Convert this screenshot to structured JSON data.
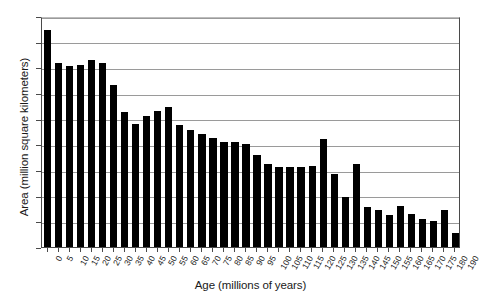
{
  "chart_data": {
    "type": "bar",
    "title": "",
    "xlabel": "Age (millions of years)",
    "ylabel": "Area (million square kilometers)",
    "xlim": [
      0,
      190
    ],
    "ylim": [
      0,
      18
    ],
    "ytick_step": 2,
    "xtick_step": 5,
    "grid": true,
    "legend": false,
    "bar_color": "#000000",
    "categories": [
      "0",
      "5",
      "10",
      "15",
      "20",
      "25",
      "30",
      "35",
      "40",
      "45",
      "50",
      "55",
      "60",
      "65",
      "70",
      "75",
      "80",
      "85",
      "90",
      "95",
      "100",
      "105",
      "110",
      "115",
      "120",
      "125",
      "130",
      "135",
      "140",
      "145",
      "150",
      "155",
      "160",
      "165",
      "170",
      "175",
      "180",
      "190"
    ],
    "yticks": [
      "0",
      "2",
      "4",
      "6",
      "8",
      "10",
      "12",
      "14",
      "16",
      "18"
    ],
    "values": [
      16.9,
      14.35,
      14.1,
      14.2,
      14.6,
      14.35,
      12.6,
      10.5,
      9.6,
      10.2,
      10.6,
      10.9,
      9.5,
      9.1,
      8.8,
      8.5,
      8.2,
      8.2,
      8.0,
      7.2,
      6.5,
      6.2,
      6.2,
      6.2,
      6.3,
      8.4,
      5.7,
      3.9,
      6.5,
      3.1,
      2.9,
      2.5,
      3.2,
      2.6,
      2.2,
      2.0,
      2.85,
      1.1
    ]
  }
}
